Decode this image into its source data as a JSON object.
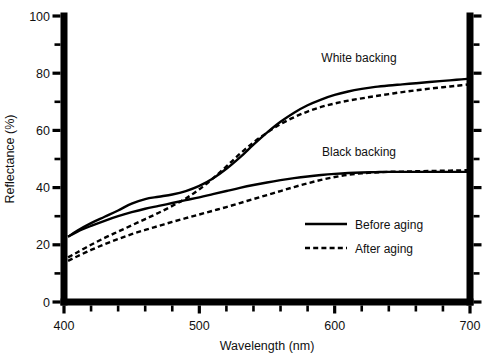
{
  "chart_data": {
    "type": "line",
    "title": "",
    "xlabel": "Wavelength (nm)",
    "ylabel": "Reflectance (%)",
    "xlim": [
      400,
      700
    ],
    "ylim": [
      0,
      100
    ],
    "xticks": [
      400,
      500,
      600,
      700
    ],
    "xtick_labels": [
      "400",
      "500",
      "600",
      "700"
    ],
    "x_minor_tick_step": 20,
    "yticks": [
      0,
      20,
      40,
      60,
      80,
      100
    ],
    "ytick_labels": [
      "0",
      "20",
      "40",
      "60",
      "80",
      "100"
    ],
    "y_minor_tick_step": 10,
    "grid": false,
    "legend_position": "center-right",
    "annotations": [
      {
        "name": "white-backing-label",
        "text": "White backing",
        "x": 618,
        "y": 84
      },
      {
        "name": "black-backing-label",
        "text": "Black backing",
        "x": 618,
        "y": 51
      }
    ],
    "legend": [
      {
        "name": "before-aging",
        "label": "Before aging",
        "style": "solid"
      },
      {
        "name": "after-aging",
        "label": "After aging",
        "style": "dashed"
      }
    ],
    "series": [
      {
        "name": "White backing - Before aging",
        "backing": "White backing",
        "condition": "Before aging",
        "style": "solid",
        "x": [
          403,
          410,
          420,
          430,
          440,
          450,
          460,
          470,
          480,
          490,
          500,
          510,
          520,
          530,
          540,
          550,
          560,
          570,
          580,
          590,
          600,
          610,
          620,
          630,
          640,
          650,
          660,
          670,
          680,
          690,
          700
        ],
        "values": [
          22.8,
          25.0,
          27.6,
          29.8,
          32.0,
          34.4,
          36.0,
          36.8,
          37.6,
          38.8,
          40.6,
          43.2,
          46.6,
          50.6,
          55.0,
          59.2,
          63.0,
          66.2,
          68.8,
          70.8,
          72.4,
          73.6,
          74.5,
          75.2,
          75.7,
          76.1,
          76.5,
          76.9,
          77.3,
          77.7,
          78.1
        ]
      },
      {
        "name": "White backing - After aging",
        "backing": "White backing",
        "condition": "After aging",
        "style": "dashed",
        "x": [
          403,
          410,
          420,
          430,
          440,
          450,
          460,
          470,
          480,
          490,
          500,
          510,
          520,
          530,
          540,
          550,
          560,
          570,
          580,
          590,
          600,
          610,
          620,
          630,
          640,
          650,
          660,
          670,
          680,
          690,
          700
        ],
        "values": [
          15.6,
          17.4,
          20.0,
          22.4,
          24.6,
          26.8,
          29.0,
          31.2,
          33.6,
          36.2,
          39.4,
          43.2,
          47.4,
          51.8,
          55.8,
          59.2,
          62.2,
          64.6,
          66.6,
          68.2,
          69.4,
          70.4,
          71.2,
          72.0,
          72.7,
          73.4,
          74.0,
          74.6,
          75.1,
          75.6,
          76.1
        ]
      },
      {
        "name": "Black backing - Before aging",
        "backing": "Black backing",
        "condition": "Before aging",
        "style": "solid",
        "x": [
          403,
          410,
          420,
          430,
          440,
          450,
          460,
          470,
          480,
          490,
          500,
          510,
          520,
          530,
          540,
          550,
          560,
          570,
          580,
          590,
          600,
          610,
          620,
          630,
          640,
          650,
          660,
          670,
          680,
          690,
          700
        ],
        "values": [
          22.8,
          24.6,
          26.6,
          28.4,
          30.0,
          31.4,
          32.6,
          33.6,
          34.6,
          35.6,
          36.6,
          37.7,
          38.8,
          39.9,
          40.9,
          41.8,
          42.6,
          43.3,
          43.9,
          44.4,
          44.8,
          45.1,
          45.3,
          45.4,
          45.5,
          45.5,
          45.5,
          45.5,
          45.5,
          45.5,
          45.5
        ]
      },
      {
        "name": "Black backing - After aging",
        "backing": "Black backing",
        "condition": "After aging",
        "style": "dashed",
        "x": [
          403,
          410,
          420,
          430,
          440,
          450,
          460,
          470,
          480,
          490,
          500,
          510,
          520,
          530,
          540,
          550,
          560,
          570,
          580,
          590,
          600,
          610,
          620,
          630,
          640,
          650,
          660,
          670,
          680,
          690,
          700
        ],
        "values": [
          14.4,
          16.0,
          18.2,
          20.2,
          22.0,
          23.7,
          25.2,
          26.6,
          28.0,
          29.3,
          30.6,
          31.9,
          33.2,
          34.6,
          36.0,
          37.4,
          38.8,
          40.2,
          41.5,
          42.7,
          43.7,
          44.5,
          45.0,
          45.3,
          45.5,
          45.6,
          45.7,
          45.8,
          45.9,
          46.0,
          46.1
        ]
      }
    ]
  }
}
